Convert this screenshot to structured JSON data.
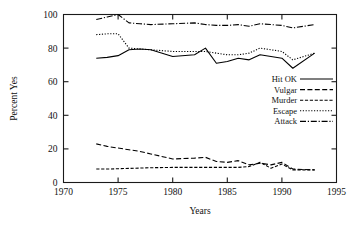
{
  "chart_data": {
    "type": "line",
    "title": "",
    "xlabel": "Years",
    "ylabel": "Percent Yes",
    "xlim": [
      1970,
      1995
    ],
    "ylim": [
      0,
      100
    ],
    "xticks": [
      1970,
      1975,
      1980,
      1985,
      1990,
      1995
    ],
    "xtick_labels": [
      "1970",
      "1975",
      "1980",
      "1985",
      "1990",
      "1995"
    ],
    "yticks": [
      0,
      20,
      40,
      60,
      80,
      100
    ],
    "ytick_labels": [
      "0",
      "20",
      "40",
      "60",
      "80",
      "100"
    ],
    "grid": false,
    "legend_position": "right-middle",
    "x": [
      1973,
      1974,
      1975,
      1976,
      1977,
      1978,
      1980,
      1982,
      1983,
      1984,
      1985,
      1986,
      1987,
      1988,
      1989,
      1990,
      1991,
      1993
    ],
    "series": [
      {
        "name": "Hit OK",
        "dash": "solid",
        "values": [
          74,
          74.5,
          75.5,
          79,
          79.5,
          79,
          75,
          76,
          80,
          71,
          72,
          74,
          73,
          76,
          75,
          74,
          68,
          77
        ]
      },
      {
        "name": "Vulgar",
        "dash": "dashed",
        "values": [
          23,
          21.5,
          20.5,
          19.5,
          18.5,
          17,
          14,
          14.5,
          15,
          12.5,
          12,
          13,
          10.5,
          11.5,
          10.5,
          12,
          8,
          7.5
        ]
      },
      {
        "name": "Murder",
        "dash": "dash-dot-dot",
        "values": [
          8,
          8,
          8.2,
          8.4,
          8.6,
          8.8,
          9,
          9,
          9,
          9,
          9,
          9,
          9.5,
          12,
          8.5,
          11,
          7.5,
          7.5
        ]
      },
      {
        "name": "Escape",
        "dash": "dotted",
        "values": [
          88,
          88.5,
          88.5,
          80,
          79.5,
          79,
          78,
          78,
          78,
          77,
          76,
          76,
          77,
          80,
          79,
          78,
          73,
          77
        ]
      },
      {
        "name": "Attack",
        "dash": "dash-dot",
        "values": [
          97,
          98.5,
          100,
          95,
          94.5,
          94,
          94.5,
          95,
          94,
          93.5,
          93.5,
          94,
          93,
          94.5,
          94,
          93.5,
          92,
          94
        ]
      }
    ],
    "legend_entries": [
      {
        "label": "Hit OK",
        "dash": "solid"
      },
      {
        "label": "Vulgar",
        "dash": "dashed"
      },
      {
        "label": "Murder",
        "dash": "dash-dot-dot"
      },
      {
        "label": "Escape",
        "dash": "dotted"
      },
      {
        "label": "Attack",
        "dash": "dash-dot"
      }
    ]
  }
}
